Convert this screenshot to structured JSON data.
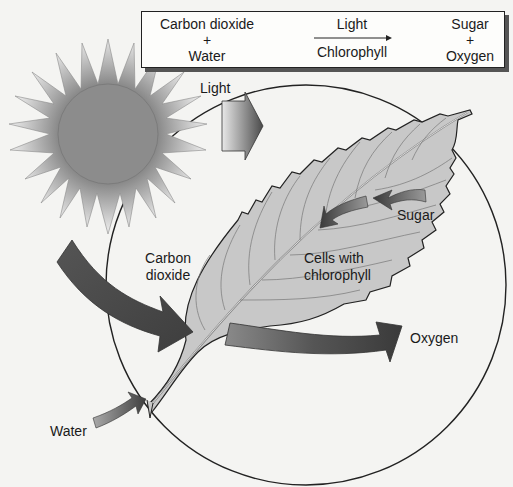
{
  "equation": {
    "reactants": {
      "line1": "Carbon dioxide",
      "op": "+",
      "line2": "Water"
    },
    "conditions": {
      "top": "Light",
      "bottom": "Chlorophyll"
    },
    "products": {
      "line1": "Sugar",
      "op": "+",
      "line2": "Oxygen"
    }
  },
  "labels": {
    "light": "Light",
    "carbon_dioxide_1": "Carbon",
    "carbon_dioxide_2": "dioxide",
    "cells_1": "Cells with",
    "cells_2": "chlorophyll",
    "sugar": "Sugar",
    "oxygen": "Oxygen",
    "water": "Water"
  },
  "colors": {
    "background": "#f4f4f2",
    "sun_core": "#8a8a8a",
    "leaf_fill": "#c9c9c9",
    "arrow_dark": "#4a4a4a",
    "arrow_light": "#d8d8d8",
    "outline": "#222222"
  }
}
